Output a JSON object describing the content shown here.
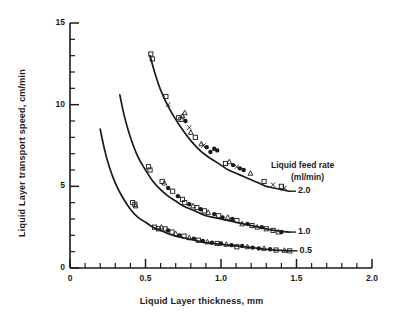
{
  "chart_data": {
    "type": "scatter",
    "title": "",
    "xlabel": "Liquid Layer thickness, mm",
    "ylabel": "Liquid Layer transport speed, cm/min",
    "xlim": [
      0,
      2.0
    ],
    "ylim": [
      0,
      15
    ],
    "xticks": [
      0,
      0.5,
      1.0,
      1.5,
      2.0
    ],
    "xtick_labels": [
      "0",
      "0.5",
      "1.0",
      "1.5",
      "2.0"
    ],
    "xminor_step": 0.1,
    "yticks": [
      0,
      5,
      10,
      15
    ],
    "ytick_labels": [
      "0",
      "5",
      "10",
      "15"
    ],
    "yminor_step": 1,
    "grid": false,
    "legend_position": "upper-right-inside",
    "legend_title_lines": [
      "Liquid feed rate",
      "(ml/min)"
    ],
    "series": [
      {
        "name": "2.0",
        "label": "2.0",
        "feed_rate_ml_min": 2.0,
        "curve": [
          [
            0.53,
            13.0
          ],
          [
            0.56,
            12.0
          ],
          [
            0.6,
            10.9
          ],
          [
            0.65,
            9.9
          ],
          [
            0.7,
            9.1
          ],
          [
            0.75,
            8.4
          ],
          [
            0.8,
            7.8
          ],
          [
            0.85,
            7.3
          ],
          [
            0.9,
            6.9
          ],
          [
            0.95,
            6.6
          ],
          [
            1.0,
            6.3
          ],
          [
            1.05,
            6.0
          ],
          [
            1.1,
            5.8
          ],
          [
            1.15,
            5.6
          ],
          [
            1.2,
            5.4
          ],
          [
            1.25,
            5.2
          ],
          [
            1.3,
            5.0
          ],
          [
            1.35,
            4.9
          ],
          [
            1.4,
            4.8
          ],
          [
            1.45,
            4.7
          ]
        ],
        "points": [
          [
            0.535,
            13.1,
            "square"
          ],
          [
            0.545,
            12.8,
            "square"
          ],
          [
            0.635,
            10.5,
            "square"
          ],
          [
            0.65,
            10.0,
            "x"
          ],
          [
            0.72,
            9.2,
            "square"
          ],
          [
            0.735,
            9.1,
            "square"
          ],
          [
            0.745,
            9.3,
            "triangle"
          ],
          [
            0.76,
            9.5,
            "triangle"
          ],
          [
            0.765,
            9.0,
            "circle"
          ],
          [
            0.79,
            8.6,
            "x"
          ],
          [
            0.8,
            8.3,
            "triangle"
          ],
          [
            0.83,
            8.0,
            "square"
          ],
          [
            0.87,
            7.6,
            "triangle"
          ],
          [
            0.885,
            7.5,
            "x"
          ],
          [
            0.905,
            7.4,
            "circle"
          ],
          [
            0.93,
            7.1,
            "circle"
          ],
          [
            0.955,
            7.3,
            "circle"
          ],
          [
            0.975,
            7.2,
            "circle"
          ],
          [
            1.03,
            6.4,
            "square"
          ],
          [
            1.055,
            6.5,
            "triangle"
          ],
          [
            1.08,
            6.3,
            "circle"
          ],
          [
            1.105,
            6.2,
            "x"
          ],
          [
            1.125,
            6.1,
            "circle"
          ],
          [
            1.15,
            6.0,
            "circle"
          ],
          [
            1.195,
            5.8,
            "triangle"
          ],
          [
            1.285,
            5.3,
            "square"
          ],
          [
            1.345,
            5.1,
            "x"
          ],
          [
            1.4,
            5.0,
            "square"
          ],
          [
            1.42,
            4.9,
            "x"
          ]
        ]
      },
      {
        "name": "1.0",
        "label": "1.0",
        "feed_rate_ml_min": 1.0,
        "curve": [
          [
            0.33,
            10.6
          ],
          [
            0.36,
            9.3
          ],
          [
            0.4,
            8.0
          ],
          [
            0.45,
            6.8
          ],
          [
            0.5,
            6.0
          ],
          [
            0.55,
            5.3
          ],
          [
            0.6,
            4.8
          ],
          [
            0.65,
            4.4
          ],
          [
            0.7,
            4.1
          ],
          [
            0.75,
            3.8
          ],
          [
            0.8,
            3.6
          ],
          [
            0.85,
            3.4
          ],
          [
            0.9,
            3.2
          ],
          [
            0.95,
            3.1
          ],
          [
            1.0,
            3.0
          ],
          [
            1.05,
            2.9
          ],
          [
            1.1,
            2.8
          ],
          [
            1.15,
            2.7
          ],
          [
            1.2,
            2.6
          ],
          [
            1.25,
            2.5
          ],
          [
            1.3,
            2.4
          ],
          [
            1.35,
            2.3
          ],
          [
            1.4,
            2.25
          ],
          [
            1.45,
            2.2
          ]
        ],
        "points": [
          [
            0.52,
            6.2,
            "square"
          ],
          [
            0.53,
            6.0,
            "square"
          ],
          [
            0.61,
            5.3,
            "square"
          ],
          [
            0.625,
            5.2,
            "triangle"
          ],
          [
            0.65,
            4.9,
            "circle"
          ],
          [
            0.68,
            4.7,
            "square"
          ],
          [
            0.715,
            4.4,
            "circle"
          ],
          [
            0.745,
            4.2,
            "square"
          ],
          [
            0.76,
            4.0,
            "square"
          ],
          [
            0.79,
            3.9,
            "circle"
          ],
          [
            0.815,
            3.8,
            "triangle"
          ],
          [
            0.84,
            3.7,
            "square"
          ],
          [
            0.865,
            3.6,
            "circle"
          ],
          [
            0.89,
            3.5,
            "square"
          ],
          [
            0.915,
            3.4,
            "triangle"
          ],
          [
            0.955,
            3.3,
            "circle"
          ],
          [
            0.985,
            3.2,
            "square"
          ],
          [
            1.01,
            3.1,
            "circle"
          ],
          [
            1.045,
            3.1,
            "triangle"
          ],
          [
            1.075,
            3.0,
            "circle"
          ],
          [
            1.105,
            2.9,
            "square"
          ],
          [
            1.14,
            2.7,
            "triangle"
          ],
          [
            1.175,
            2.7,
            "circle"
          ],
          [
            1.205,
            2.6,
            "square"
          ],
          [
            1.24,
            2.5,
            "triangle"
          ],
          [
            1.27,
            2.5,
            "circle"
          ],
          [
            1.3,
            2.4,
            "square"
          ],
          [
            1.345,
            2.3,
            "square"
          ],
          [
            1.38,
            2.2,
            "triangle"
          ],
          [
            1.4,
            2.2,
            "circle"
          ]
        ]
      },
      {
        "name": "0.5",
        "label": "0.5",
        "feed_rate_ml_min": 0.5,
        "curve": [
          [
            0.2,
            8.5
          ],
          [
            0.23,
            7.2
          ],
          [
            0.26,
            6.2
          ],
          [
            0.3,
            5.2
          ],
          [
            0.35,
            4.3
          ],
          [
            0.4,
            3.6
          ],
          [
            0.45,
            3.1
          ],
          [
            0.5,
            2.8
          ],
          [
            0.55,
            2.5
          ],
          [
            0.6,
            2.3
          ],
          [
            0.65,
            2.1
          ],
          [
            0.7,
            1.95
          ],
          [
            0.75,
            1.85
          ],
          [
            0.8,
            1.75
          ],
          [
            0.85,
            1.65
          ],
          [
            0.9,
            1.55
          ],
          [
            0.95,
            1.5
          ],
          [
            1.0,
            1.45
          ],
          [
            1.05,
            1.4
          ],
          [
            1.1,
            1.35
          ],
          [
            1.15,
            1.3
          ],
          [
            1.2,
            1.25
          ],
          [
            1.25,
            1.2
          ],
          [
            1.3,
            1.15
          ],
          [
            1.35,
            1.1
          ],
          [
            1.4,
            1.08
          ],
          [
            1.46,
            1.05
          ]
        ],
        "points": [
          [
            0.415,
            4.0,
            "square"
          ],
          [
            0.43,
            3.9,
            "square"
          ],
          [
            0.435,
            3.8,
            "triangle"
          ],
          [
            0.56,
            2.5,
            "square"
          ],
          [
            0.585,
            2.4,
            "square"
          ],
          [
            0.605,
            2.5,
            "triangle"
          ],
          [
            0.63,
            2.4,
            "square"
          ],
          [
            0.65,
            2.3,
            "circle"
          ],
          [
            0.675,
            2.2,
            "square"
          ],
          [
            0.7,
            2.1,
            "triangle"
          ],
          [
            0.725,
            2.0,
            "circle"
          ],
          [
            0.755,
            1.95,
            "square"
          ],
          [
            0.79,
            1.85,
            "triangle"
          ],
          [
            0.82,
            1.8,
            "circle"
          ],
          [
            0.85,
            1.7,
            "square"
          ],
          [
            0.88,
            1.65,
            "circle"
          ],
          [
            0.91,
            1.6,
            "triangle"
          ],
          [
            0.94,
            1.55,
            "circle"
          ],
          [
            0.975,
            1.5,
            "square"
          ],
          [
            1.0,
            1.5,
            "circle"
          ],
          [
            1.035,
            1.45,
            "triangle"
          ],
          [
            1.07,
            1.4,
            "circle"
          ],
          [
            1.105,
            1.3,
            "square"
          ],
          [
            1.14,
            1.35,
            "circle"
          ],
          [
            1.175,
            1.3,
            "triangle"
          ],
          [
            1.21,
            1.25,
            "circle"
          ],
          [
            1.25,
            1.2,
            "circle"
          ],
          [
            1.285,
            1.2,
            "triangle"
          ],
          [
            1.325,
            1.15,
            "circle"
          ],
          [
            1.365,
            1.1,
            "square"
          ],
          [
            1.42,
            1.08,
            "triangle"
          ],
          [
            1.455,
            1.05,
            "square"
          ]
        ]
      }
    ]
  }
}
